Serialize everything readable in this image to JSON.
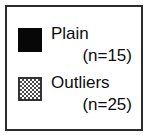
{
  "legend": {
    "border_color": "#2b2b2b",
    "background_color": "#ffffff",
    "text_color": "#0d0d0d",
    "entries": [
      {
        "label": "Plain",
        "count_text": "(n=15)",
        "n": 15,
        "swatch": "solid-black-square",
        "swatch_color": "#070707"
      },
      {
        "label": "Outliers",
        "count_text": "(n=25)",
        "n": 25,
        "swatch": "checkered-gray-square",
        "swatch_color": "#4a4a4a"
      }
    ]
  },
  "chart_data": {
    "type": "table",
    "title": "",
    "categories": [
      "Plain",
      "Outliers"
    ],
    "values": [
      15,
      25
    ],
    "series": [
      {
        "name": "sample size",
        "values": [
          15,
          25
        ]
      }
    ],
    "annotations": [
      "(n=15)",
      "(n=25)"
    ],
    "legend_position": "standalone",
    "grid": false,
    "xlabel": "",
    "ylabel": ""
  }
}
